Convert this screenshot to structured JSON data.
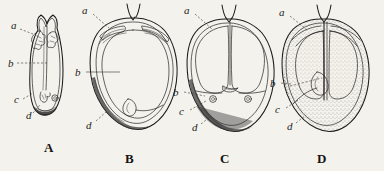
{
  "plate": {
    "title": "Seed structure comparative plate",
    "background_color": "#f4f2ec",
    "ink_color": "#1b1b1b",
    "figures": [
      {
        "caption": "A",
        "caption_x": 50,
        "caption_y": 152,
        "description": "narrow elongate seed, longitudinal section, notched apex",
        "labels": [
          {
            "text": "a",
            "x": 11,
            "y": 29
          },
          {
            "text": "b",
            "x": 8,
            "y": 63
          },
          {
            "text": "c",
            "x": 14,
            "y": 100
          },
          {
            "text": "d",
            "x": 26,
            "y": 117
          }
        ]
      },
      {
        "caption": "B",
        "caption_x": 131,
        "caption_y": 162,
        "description": "broad ovoid seed, longitudinal section with thick shaded testa",
        "labels": [
          {
            "text": "a",
            "x": 84,
            "y": 12
          },
          {
            "text": "b",
            "x": 77,
            "y": 70
          },
          {
            "text": "d",
            "x": 88,
            "y": 124
          }
        ]
      },
      {
        "caption": "C",
        "caption_x": 226,
        "caption_y": 162,
        "description": "ovoid seed showing two cotyledon lobes and basal chambers",
        "labels": [
          {
            "text": "a",
            "x": 186,
            "y": 12
          },
          {
            "text": "b",
            "x": 175,
            "y": 92
          },
          {
            "text": "c",
            "x": 181,
            "y": 112
          },
          {
            "text": "d",
            "x": 194,
            "y": 128
          }
        ]
      },
      {
        "caption": "D",
        "caption_x": 323,
        "caption_y": 162,
        "description": "ovoid seed with dense stippled endosperm and central radicle",
        "labels": [
          {
            "text": "a",
            "x": 281,
            "y": 14
          },
          {
            "text": "b",
            "x": 272,
            "y": 83
          },
          {
            "text": "c",
            "x": 277,
            "y": 110
          },
          {
            "text": "d",
            "x": 289,
            "y": 127
          }
        ]
      }
    ]
  }
}
